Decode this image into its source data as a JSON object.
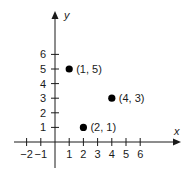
{
  "chart_data": {
    "type": "scatter",
    "title": "",
    "xlabel": "x",
    "ylabel": "y",
    "xlim": [
      -2.5,
      8.7
    ],
    "ylim": [
      -1.8,
      8.8
    ],
    "grid": false,
    "x_ticks": [
      -2,
      -1,
      1,
      2,
      3,
      4,
      5,
      6
    ],
    "x_tick_labels": [
      "−2",
      "−1",
      "1",
      "2",
      "3",
      "4",
      "5",
      "6"
    ],
    "y_ticks": [
      1,
      2,
      3,
      4,
      5,
      6
    ],
    "y_tick_labels": [
      "1",
      "2",
      "3",
      "4",
      "5",
      "6"
    ],
    "series": [
      {
        "name": "points",
        "points": [
          {
            "x": 1,
            "y": 5,
            "label": "(1, 5)"
          },
          {
            "x": 4,
            "y": 3,
            "label": "(4, 3)"
          },
          {
            "x": 2,
            "y": 1,
            "label": "(2, 1)"
          }
        ]
      }
    ],
    "colors": {
      "axis": "#1a1a1a",
      "point": "#000000"
    }
  }
}
